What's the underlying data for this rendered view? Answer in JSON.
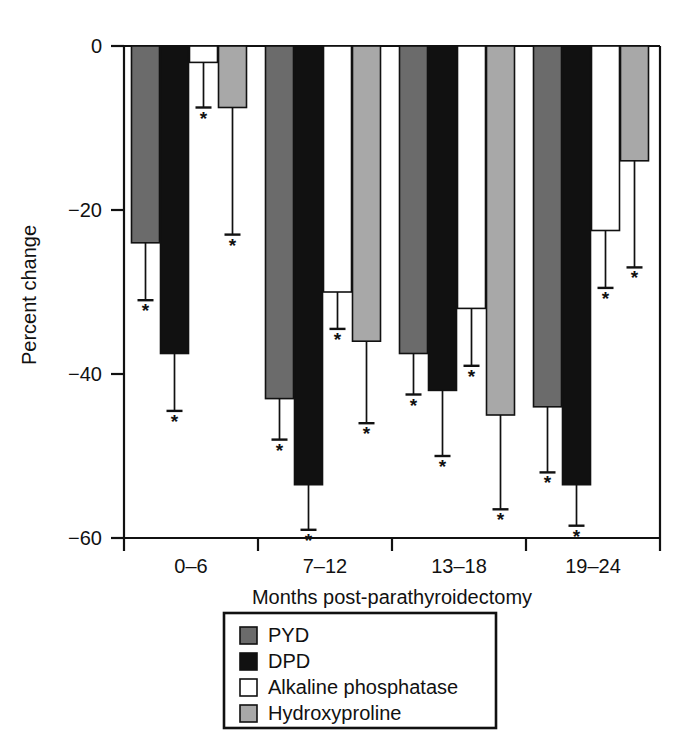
{
  "chart_data": {
    "type": "bar",
    "title": "",
    "xlabel": "Months post-parathyroidectomy",
    "ylabel": "Percent change",
    "categories": [
      "0–6",
      "7–12",
      "13–18",
      "19–24"
    ],
    "ylim": [
      -60,
      0
    ],
    "yticks": [
      0,
      -20,
      -40,
      -60
    ],
    "ytick_labels": [
      "0",
      "−20",
      "−40",
      "−60"
    ],
    "grid": false,
    "legend_position": "bottom-center",
    "annotation_marker": "*",
    "annotation_meaning": "statistically significant change",
    "series": [
      {
        "name": "PYD",
        "color": "#6b6b6b",
        "values": [
          -24.0,
          -43.0,
          -37.5,
          -44.0
        ],
        "errors": [
          7.0,
          5.0,
          5.0,
          8.0
        ],
        "significant": [
          true,
          true,
          true,
          true
        ]
      },
      {
        "name": "DPD",
        "color": "#111111",
        "values": [
          -37.5,
          -53.5,
          -42.0,
          -53.5
        ],
        "errors": [
          7.0,
          5.5,
          8.0,
          5.0
        ],
        "significant": [
          true,
          true,
          true,
          true
        ]
      },
      {
        "name": "Alkaline phosphatase",
        "color": "#ffffff",
        "values": [
          -2.0,
          -30.0,
          -32.0,
          -22.5
        ],
        "errors": [
          5.5,
          4.5,
          7.0,
          7.0
        ],
        "significant": [
          true,
          true,
          true,
          true
        ]
      },
      {
        "name": "Hydroxyproline",
        "color": "#a8a8a8",
        "values": [
          -7.5,
          -36.0,
          -45.0,
          -14.0
        ],
        "errors": [
          15.5,
          10.0,
          11.5,
          13.0
        ],
        "significant": [
          true,
          true,
          true,
          true
        ]
      }
    ]
  },
  "legend": {
    "entries": [
      {
        "label": "PYD",
        "color": "#6b6b6b"
      },
      {
        "label": "DPD",
        "color": "#111111"
      },
      {
        "label": "Alkaline phosphatase",
        "color": "#ffffff"
      },
      {
        "label": "Hydroxyproline",
        "color": "#a8a8a8"
      }
    ]
  }
}
